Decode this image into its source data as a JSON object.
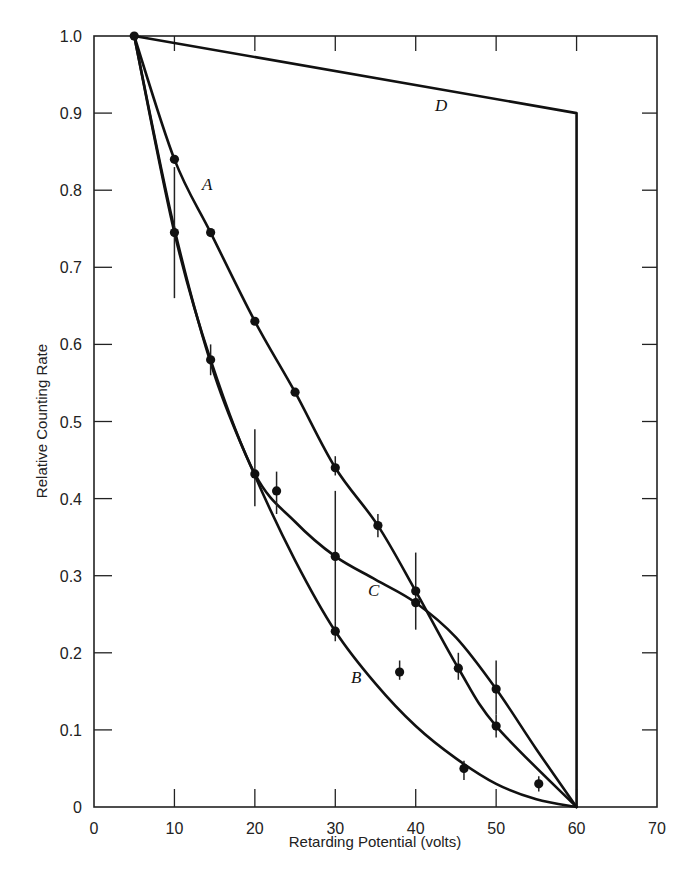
{
  "chart_data": {
    "type": "line",
    "title": "",
    "xlabel": "Retarding Potential (volts)",
    "ylabel": "Relative Counting Rate",
    "xlim": [
      0,
      70
    ],
    "ylim": [
      0,
      1.0
    ],
    "grid": false,
    "legend": "none (curves labeled inline A, B, C, D)",
    "x_ticks": [
      "0",
      "10",
      "20",
      "30",
      "40",
      "50",
      "60",
      "70"
    ],
    "y_ticks": [
      "0",
      "0.1",
      "0.2",
      "0.3",
      "0.4",
      "0.5",
      "0.6",
      "0.7",
      "0.8",
      "0.9",
      "1.0"
    ],
    "series": [
      {
        "name": "A",
        "points": [
          [
            5,
            1.0
          ],
          [
            10,
            0.84
          ],
          [
            14.5,
            0.745
          ],
          [
            20,
            0.63
          ],
          [
            25,
            0.538
          ],
          [
            30,
            0.44
          ],
          [
            35.3,
            0.365
          ],
          [
            40,
            0.28
          ],
          [
            45.3,
            0.18
          ],
          [
            50,
            0.105
          ],
          [
            60,
            0.0
          ]
        ]
      },
      {
        "name": "B",
        "curve": [
          [
            5,
            1.0
          ],
          [
            10,
            0.75
          ],
          [
            15,
            0.56
          ],
          [
            20,
            0.43
          ],
          [
            25,
            0.32
          ],
          [
            30,
            0.228
          ],
          [
            35,
            0.16
          ],
          [
            40,
            0.105
          ],
          [
            45,
            0.063
          ],
          [
            50,
            0.03
          ],
          [
            55,
            0.01
          ],
          [
            60,
            0.0
          ]
        ]
      },
      {
        "name": "C",
        "curve": [
          [
            5,
            1.0
          ],
          [
            10,
            0.745
          ],
          [
            14.5,
            0.58
          ],
          [
            20,
            0.432
          ],
          [
            25,
            0.37
          ],
          [
            30,
            0.325
          ],
          [
            35,
            0.295
          ],
          [
            40,
            0.265
          ],
          [
            45,
            0.22
          ],
          [
            50,
            0.153
          ],
          [
            55,
            0.075
          ],
          [
            60,
            0.0
          ]
        ]
      },
      {
        "name": "D",
        "points": [
          [
            5,
            1.0
          ],
          [
            60,
            0.9
          ],
          [
            60,
            0.0
          ]
        ]
      }
    ],
    "measured_points": [
      {
        "x": 5,
        "y": 1.0
      },
      {
        "x": 10,
        "y": 0.84
      },
      {
        "x": 10,
        "y": 0.745,
        "err": [
          0.66,
          0.83
        ]
      },
      {
        "x": 14.5,
        "y": 0.745
      },
      {
        "x": 14.5,
        "y": 0.58,
        "err": [
          0.56,
          0.6
        ]
      },
      {
        "x": 20,
        "y": 0.63
      },
      {
        "x": 20,
        "y": 0.432,
        "err": [
          0.39,
          0.49
        ]
      },
      {
        "x": 22.7,
        "y": 0.41,
        "err": [
          0.38,
          0.435
        ]
      },
      {
        "x": 25,
        "y": 0.538
      },
      {
        "x": 30,
        "y": 0.44,
        "err": [
          0.43,
          0.455
        ]
      },
      {
        "x": 30,
        "y": 0.325,
        "err": [
          0.24,
          0.41
        ]
      },
      {
        "x": 30,
        "y": 0.228,
        "err": [
          0.215,
          0.24
        ]
      },
      {
        "x": 35.3,
        "y": 0.365,
        "err": [
          0.35,
          0.38
        ]
      },
      {
        "x": 38,
        "y": 0.175,
        "err": [
          0.165,
          0.19
        ]
      },
      {
        "x": 40,
        "y": 0.28,
        "err": [
          0.23,
          0.33
        ]
      },
      {
        "x": 40,
        "y": 0.265
      },
      {
        "x": 45.3,
        "y": 0.18,
        "err": [
          0.165,
          0.2
        ]
      },
      {
        "x": 46,
        "y": 0.05,
        "err": [
          0.035,
          0.06
        ]
      },
      {
        "x": 50,
        "y": 0.153,
        "err": [
          0.12,
          0.19
        ]
      },
      {
        "x": 50,
        "y": 0.105,
        "err": [
          0.09,
          0.12
        ]
      },
      {
        "x": 55.3,
        "y": 0.03,
        "err": [
          0.02,
          0.04
        ]
      }
    ],
    "annotations": [
      {
        "text": "A",
        "x": 13.5,
        "y": 0.81
      },
      {
        "text": "B",
        "x": 32,
        "y": 0.16
      },
      {
        "text": "C",
        "x": 34.5,
        "y": 0.275
      },
      {
        "text": "D",
        "x": 41,
        "y": 0.925
      }
    ]
  },
  "labels": {
    "xlabel": "Retarding Potential (volts)",
    "ylabel": "Relative Counting Rate",
    "curve_a": "A",
    "curve_b": "B",
    "curve_c": "C",
    "curve_d": "D",
    "x_ticks": [
      "0",
      "10",
      "20",
      "30",
      "40",
      "50",
      "60",
      "70"
    ],
    "y_ticks": [
      "0",
      "0.1",
      "0.2",
      "0.3",
      "0.4",
      "0.5",
      "0.6",
      "0.7",
      "0.8",
      "0.9",
      "1.0"
    ]
  }
}
